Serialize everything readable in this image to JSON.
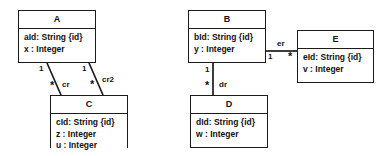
{
  "diagram": {
    "type": "uml-class-diagram",
    "classes": [
      {
        "id": "A",
        "name": "A",
        "attributes": [
          "aId: String {id}",
          "x : Integer"
        ],
        "x": 18,
        "y": 10,
        "width": 78,
        "height": 53
      },
      {
        "id": "B",
        "name": "B",
        "attributes": [
          "bId: String {id}",
          "y : Integer"
        ],
        "x": 188,
        "y": 10,
        "width": 78,
        "height": 53
      },
      {
        "id": "E",
        "name": "E",
        "attributes": [
          "eId: String {id}",
          "v : Integer"
        ],
        "x": 297,
        "y": 30,
        "width": 77,
        "height": 53
      },
      {
        "id": "C",
        "name": "C",
        "attributes": [
          "cId: String {id}",
          "z : Integer",
          "u : Integer"
        ],
        "x": 50,
        "y": 95,
        "width": 78,
        "height": 53
      },
      {
        "id": "D",
        "name": "D",
        "attributes": [
          "dId: String {id}",
          "w : Integer"
        ],
        "x": 190,
        "y": 95,
        "width": 78,
        "height": 53
      }
    ],
    "associations": [
      {
        "id": "cr",
        "label": "cr",
        "source": "A",
        "target": "C",
        "source_multiplicity": "1",
        "target_multiplicity": "*",
        "label_x": 62,
        "label_y": 80,
        "source_mult_x": 39,
        "source_mult_y": 64,
        "target_mult_x": 50,
        "target_mult_y": 80
      },
      {
        "id": "cr2",
        "label": "cr2",
        "source": "A",
        "target": "C",
        "source_multiplicity": "1",
        "target_multiplicity": "*",
        "label_x": 103,
        "label_y": 76,
        "source_mult_x": 82,
        "source_mult_y": 64,
        "target_mult_x": 90,
        "target_mult_y": 79
      },
      {
        "id": "dr",
        "label": "dr",
        "source": "B",
        "target": "D",
        "source_multiplicity": "1",
        "target_multiplicity": "*",
        "label_x": 220,
        "label_y": 80,
        "source_mult_x": 205,
        "source_mult_y": 65,
        "target_mult_x": 207,
        "target_mult_y": 80
      },
      {
        "id": "er",
        "label": "er",
        "source": "B",
        "target": "E",
        "source_multiplicity": "1",
        "target_multiplicity": "*",
        "label_x": 283,
        "label_y": 39,
        "source_mult_x": 267,
        "source_mult_y": 51,
        "target_mult_x": 286,
        "target_mult_y": 49
      }
    ],
    "colors": {
      "stroke": "#1b1b1b",
      "fill": "#ffffff",
      "text": "#111111"
    }
  }
}
